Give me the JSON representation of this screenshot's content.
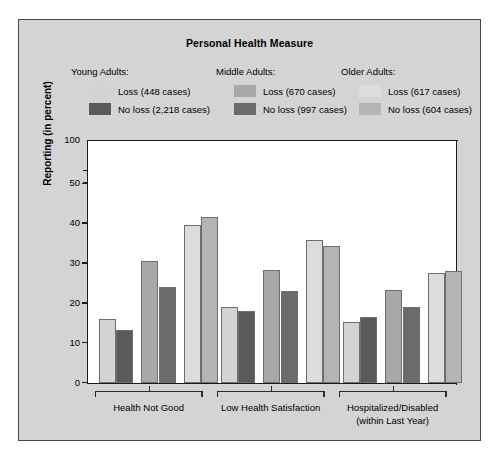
{
  "chart_data": {
    "type": "bar",
    "title": "Personal Health Measure",
    "xlabel": "",
    "ylabel": "Reporting (in percent)",
    "ylim": [
      0,
      100
    ],
    "yticks": [
      0,
      10,
      20,
      30,
      40,
      50,
      100
    ],
    "axis_break": true,
    "axis_break_between": [
      50,
      100
    ],
    "grid": false,
    "legend_position": "top",
    "categories": [
      "Health Not Good",
      "Low Health Satisfaction",
      "Hospitalized/Disabled (within Last Year)"
    ],
    "series": [
      {
        "name": "Young Adults: Loss (448 cases)",
        "color": "#d3d3d3",
        "values": [
          16.0,
          19.0,
          15.2
        ]
      },
      {
        "name": "Young Adults: No loss (2,218 cases)",
        "color": "#5a5a5a",
        "values": [
          13.2,
          17.8,
          16.5
        ]
      },
      {
        "name": "Middle Adults: Loss (670 cases)",
        "color": "#a8a8a8",
        "values": [
          30.5,
          28.3,
          23.3
        ]
      },
      {
        "name": "Middle Adults: No loss (997 cases)",
        "color": "#6b6b6b",
        "values": [
          23.9,
          23.0,
          19.0
        ]
      },
      {
        "name": "Older Adults: Loss (617 cases)",
        "color": "#dcdcdc",
        "values": [
          39.4,
          35.6,
          27.5
        ]
      },
      {
        "name": "Older Adults: No loss (604 cases)",
        "color": "#b4b4b4",
        "values": [
          41.4,
          34.3,
          28.0
        ]
      }
    ]
  },
  "legend": {
    "groups": [
      {
        "heading": "Young Adults:",
        "rows": [
          {
            "label": "Loss (448 cases)",
            "color": "#d3d3d3",
            "swatch_name": "legend-swatch-young-loss"
          },
          {
            "label": "No loss (2,218 cases)",
            "color": "#5a5a5a",
            "swatch_name": "legend-swatch-young-noloss"
          }
        ]
      },
      {
        "heading": "Middle Adults:",
        "rows": [
          {
            "label": "Loss (670 cases)",
            "color": "#a8a8a8",
            "swatch_name": "legend-swatch-middle-loss"
          },
          {
            "label": "No loss (997 cases)",
            "color": "#6b6b6b",
            "swatch_name": "legend-swatch-middle-noloss"
          }
        ]
      },
      {
        "heading": "Older Adults:",
        "rows": [
          {
            "label": "Loss (617 cases)",
            "color": "#dcdcdc",
            "swatch_name": "legend-swatch-older-loss"
          },
          {
            "label": "No loss (604 cases)",
            "color": "#b4b4b4",
            "swatch_name": "legend-swatch-older-noloss"
          }
        ]
      }
    ]
  },
  "axis": {
    "y_label": "Reporting (in percent)",
    "y_ticks": [
      "100",
      "50",
      "40",
      "30",
      "20",
      "10",
      "0"
    ]
  },
  "x_axis": {
    "categories": [
      {
        "lines": [
          "Health Not Good"
        ]
      },
      {
        "lines": [
          "Low Health Satisfaction"
        ]
      },
      {
        "lines": [
          "Hospitalized/Disabled",
          "(within Last Year)"
        ]
      }
    ]
  },
  "colors": {
    "figure_background": "#d4d4d4",
    "plot_background": "#ffffff",
    "axis": "#1a1a1a",
    "border": "#4a4a4a",
    "bar_outline": "#6e6e6e"
  }
}
